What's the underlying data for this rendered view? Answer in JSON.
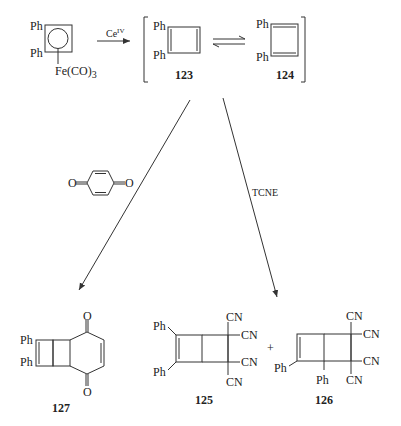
{
  "diagram": {
    "type": "reaction-scheme",
    "background": "#ffffff",
    "line_color": "#333333",
    "starting_material": {
      "substituents": [
        "Ph",
        "Ph"
      ],
      "complex": "Fe(CO)3",
      "fe_label": "Fe(CO)",
      "fe_sub": "3"
    },
    "reagent_oxidation": {
      "label": "Ce",
      "superscript": "IV"
    },
    "intermediates": [
      {
        "id": "123",
        "label": "123",
        "substituents": [
          "Ph",
          "Ph"
        ]
      },
      {
        "id": "124",
        "label": "124",
        "substituents": [
          "Ph",
          "Ph"
        ]
      }
    ],
    "equilibrium": "⇌",
    "pathways": [
      {
        "reagent": "p-benzoquinone",
        "reagent_atoms": [
          "O",
          "O"
        ],
        "product": {
          "id": "127",
          "label": "127",
          "substituents": [
            "Ph",
            "Ph"
          ],
          "oxygens": [
            "O",
            "O"
          ]
        }
      },
      {
        "reagent": "TCNE",
        "reagent_label": "TCNE",
        "products": [
          {
            "id": "125",
            "label": "125",
            "substituents": [
              "Ph",
              "Ph"
            ],
            "groups": [
              "CN",
              "CN",
              "CN",
              "CN"
            ]
          },
          {
            "id": "126",
            "label": "126",
            "substituents": [
              "Ph",
              "Ph"
            ],
            "groups": [
              "CN",
              "CN",
              "CN",
              "CN"
            ]
          }
        ],
        "plus": "+"
      }
    ]
  }
}
